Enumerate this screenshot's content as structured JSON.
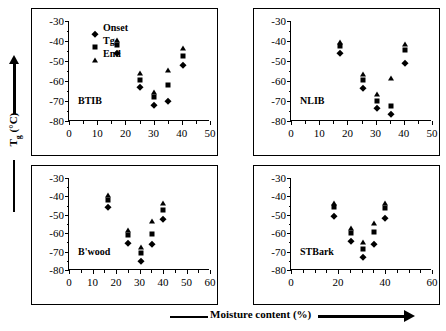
{
  "figure": {
    "y_axis_caption": "Tg (°C)",
    "y_axis_caption_base": "T",
    "y_axis_caption_sub": "g",
    "y_axis_caption_unit": " (°C)",
    "x_axis_caption": "Moisture content (%)"
  },
  "legend": {
    "items": [
      {
        "label": "Onset",
        "marker": "diamond-marker"
      },
      {
        "label": "Tg",
        "marker": "square-marker"
      },
      {
        "label": "End",
        "marker": "triangle-marker"
      }
    ]
  },
  "chart_data": [
    {
      "type": "scatter",
      "title": "BTIB",
      "panel_index": 0,
      "xlabel": "Moisture content (%)",
      "ylabel": "Tg (°C)",
      "xlim": [
        0,
        50
      ],
      "ylim": [
        -80,
        -30
      ],
      "xticks": [
        0,
        10,
        20,
        30,
        40,
        50
      ],
      "yticks": [
        -30,
        -40,
        -50,
        -60,
        -70,
        -80
      ],
      "x_minor_step": 5,
      "y_minor_step": 5,
      "grid": false,
      "legend_position": "top-left",
      "x": [
        17,
        25,
        30,
        35,
        40.5
      ],
      "series": [
        {
          "name": "Onset",
          "values": [
            -46,
            -63,
            -72,
            -70,
            -52
          ]
        },
        {
          "name": "Tg",
          "values": [
            -42,
            -59.5,
            -68,
            -62,
            -47.5
          ]
        },
        {
          "name": "End",
          "values": [
            -39.5,
            -56,
            -65.5,
            -54.5,
            -43.5
          ]
        }
      ]
    },
    {
      "type": "scatter",
      "title": "NLIB",
      "panel_index": 1,
      "xlabel": "Moisture content (%)",
      "ylabel": "Tg (°C)",
      "xlim": [
        0,
        50
      ],
      "ylim": [
        -80,
        -30
      ],
      "xticks": [
        0,
        10,
        20,
        30,
        40,
        50
      ],
      "yticks": [
        -30,
        -40,
        -50,
        -60,
        -70,
        -80
      ],
      "x_minor_step": 5,
      "y_minor_step": 5,
      "grid": false,
      "legend_position": "none",
      "x": [
        17.5,
        25.5,
        30.5,
        35.5,
        40.5
      ],
      "series": [
        {
          "name": "Onset",
          "values": [
            -46,
            -63.5,
            -73.5,
            -76.5,
            -51
          ]
        },
        {
          "name": "Tg",
          "values": [
            -42.5,
            -59.5,
            -70,
            -72.5,
            -44.5
          ]
        },
        {
          "name": "End",
          "values": [
            -40.5,
            -56.5,
            -66.5,
            -58.5,
            -41.5
          ]
        }
      ]
    },
    {
      "type": "scatter",
      "title": "B'wood",
      "panel_index": 2,
      "xlabel": "Moisture content (%)",
      "ylabel": "Tg (°C)",
      "xlim": [
        0,
        60
      ],
      "ylim": [
        -80,
        -30
      ],
      "xticks": [
        0,
        10,
        20,
        30,
        40,
        50,
        60
      ],
      "yticks": [
        -30,
        -40,
        -50,
        -60,
        -70,
        -80
      ],
      "x_minor_step": 5,
      "y_minor_step": 5,
      "grid": false,
      "legend_position": "none",
      "x": [
        16.5,
        25,
        30.5,
        35.5,
        40
      ],
      "series": [
        {
          "name": "Onset",
          "values": [
            -45.5,
            -65.5,
            -75,
            -66,
            -52.5
          ]
        },
        {
          "name": "Tg",
          "values": [
            -42,
            -61,
            -70.5,
            -60.5,
            -47.5
          ]
        },
        {
          "name": "End",
          "values": [
            -39,
            -58,
            -67.5,
            -53.5,
            -43.5
          ]
        }
      ]
    },
    {
      "type": "scatter",
      "title": "STBark",
      "panel_index": 3,
      "xlabel": "Moisture content (%)",
      "ylabel": "Tg (°C)",
      "xlim": [
        0,
        60
      ],
      "ylim": [
        -80,
        -30
      ],
      "xticks": [
        0,
        20,
        40,
        60
      ],
      "yticks": [
        -30,
        -40,
        -50,
        -60,
        -70,
        -80
      ],
      "x_minor_step": 5,
      "y_minor_step": 5,
      "grid": false,
      "legend_position": "none",
      "x": [
        18.5,
        25.5,
        30.5,
        35.5,
        40
      ],
      "series": [
        {
          "name": "Onset",
          "values": [
            -50.5,
            -64,
            -73,
            -66,
            -52
          ]
        },
        {
          "name": "Tg",
          "values": [
            -46,
            -60,
            -68.5,
            -59.5,
            -46.5
          ]
        },
        {
          "name": "End",
          "values": [
            -43.5,
            -57,
            -65,
            -54.5,
            -43.5
          ]
        }
      ]
    }
  ]
}
